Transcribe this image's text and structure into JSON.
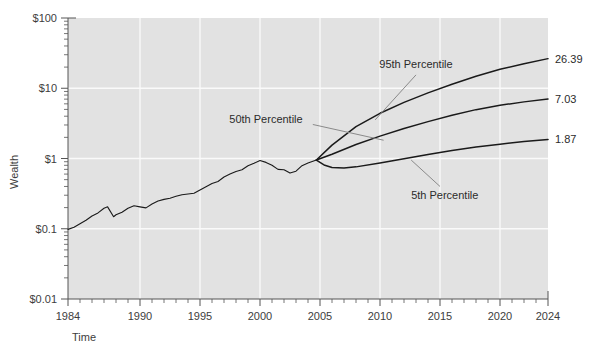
{
  "chart_data": {
    "type": "line",
    "title": "",
    "xlabel": "Time",
    "ylabel": "Wealth",
    "xlim": [
      1984,
      2024
    ],
    "ylim": [
      0.01,
      100
    ],
    "yscale": "log",
    "grid": true,
    "legend_position": "none",
    "x_tick_labels": [
      "1984",
      "1990",
      "1995",
      "2000",
      "2005",
      "2010",
      "2015",
      "2020",
      "2024"
    ],
    "x_tick_values": [
      1984,
      1990,
      1995,
      2000,
      2005,
      2010,
      2015,
      2020,
      2024
    ],
    "y_tick_labels": [
      "$100",
      "$10",
      "$1",
      "$0.1",
      "$0.01"
    ],
    "y_tick_values": [
      100,
      10,
      1,
      0.1,
      0.01
    ],
    "fan_origin": {
      "x": 2004.7,
      "y": 1.0
    },
    "annotations": [
      {
        "text": "95th Percentile",
        "x": 2013.0,
        "y": 22.0
      },
      {
        "text": "50th Percentile",
        "x": 2000.5,
        "y": 3.6
      },
      {
        "text": "5th Percentile",
        "x": 2015.4,
        "y": 0.3
      }
    ],
    "endpoint_labels": [
      {
        "text": "26.39",
        "value": 26.39,
        "series": "95th Percentile"
      },
      {
        "text": "7.03",
        "value": 7.03,
        "series": "50th Percentile"
      },
      {
        "text": "1.87",
        "value": 1.87,
        "series": "5th Percentile"
      }
    ],
    "series": [
      {
        "name": "Historical Wealth",
        "x": [
          1984.0,
          1984.5,
          1985.0,
          1985.5,
          1986.0,
          1986.5,
          1987.0,
          1987.3,
          1987.8,
          1988.0,
          1988.5,
          1989.0,
          1989.5,
          1990.0,
          1990.5,
          1991.0,
          1991.5,
          1992.0,
          1992.5,
          1993.0,
          1993.5,
          1994.0,
          1994.5,
          1995.0,
          1995.5,
          1996.0,
          1996.5,
          1997.0,
          1997.5,
          1998.0,
          1998.5,
          1999.0,
          1999.5,
          2000.0,
          2000.5,
          2001.0,
          2001.5,
          2002.0,
          2002.5,
          2003.0,
          2003.5,
          2004.0,
          2004.7
        ],
        "values": [
          0.098,
          0.105,
          0.118,
          0.132,
          0.152,
          0.168,
          0.196,
          0.205,
          0.148,
          0.158,
          0.172,
          0.196,
          0.212,
          0.205,
          0.198,
          0.225,
          0.248,
          0.262,
          0.272,
          0.29,
          0.305,
          0.312,
          0.32,
          0.355,
          0.395,
          0.44,
          0.47,
          0.545,
          0.6,
          0.655,
          0.69,
          0.79,
          0.855,
          0.935,
          0.88,
          0.8,
          0.7,
          0.69,
          0.62,
          0.66,
          0.79,
          0.86,
          0.95
        ]
      },
      {
        "name": "95th Percentile",
        "x": [
          2004.7,
          2006.0,
          2008.0,
          2010.0,
          2012.0,
          2014.0,
          2016.0,
          2018.0,
          2020.0,
          2022.0,
          2024.0
        ],
        "values": [
          0.95,
          1.55,
          2.85,
          4.4,
          6.3,
          8.6,
          11.4,
          14.8,
          18.6,
          22.4,
          26.39
        ]
      },
      {
        "name": "50th Percentile",
        "x": [
          2004.7,
          2006.0,
          2008.0,
          2010.0,
          2012.0,
          2014.0,
          2016.0,
          2018.0,
          2020.0,
          2022.0,
          2024.0
        ],
        "values": [
          0.95,
          1.15,
          1.58,
          2.08,
          2.68,
          3.35,
          4.12,
          4.96,
          5.72,
          6.4,
          7.03
        ]
      },
      {
        "name": "5th Percentile",
        "x": [
          2004.7,
          2005.4,
          2006.0,
          2007.0,
          2008.0,
          2010.0,
          2012.0,
          2014.0,
          2016.0,
          2018.0,
          2020.0,
          2022.0,
          2024.0
        ],
        "values": [
          0.95,
          0.8,
          0.745,
          0.735,
          0.76,
          0.865,
          0.995,
          1.14,
          1.3,
          1.46,
          1.6,
          1.74,
          1.87
        ]
      }
    ]
  },
  "axes": {
    "xlabel": "Time",
    "ylabel": "Wealth"
  }
}
